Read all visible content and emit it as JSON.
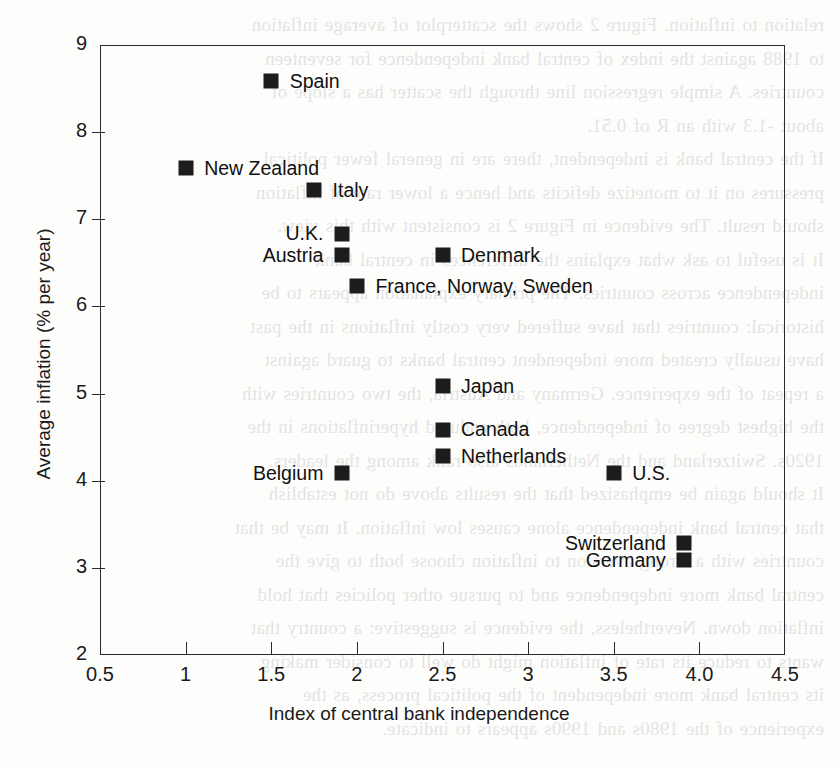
{
  "figure": {
    "background_color": "#ffffff",
    "marker_color": "#1c1c1c",
    "axis_color": "#2b2b2b"
  },
  "chart_data": {
    "type": "scatter",
    "title": "",
    "xlabel": "Index of central bank independence",
    "ylabel": "Average inflation (% per year)",
    "xlim": [
      0.5,
      4.5
    ],
    "ylim": [
      2,
      9
    ],
    "xticks": [
      0.5,
      1,
      1.5,
      2,
      2.5,
      3,
      3.5,
      4.0,
      4.5
    ],
    "xtick_labels": [
      "0.5",
      "1",
      "1.5",
      "2",
      "2.5",
      "3",
      "3.5",
      "4.0",
      "4.5"
    ],
    "yticks": [
      2,
      3,
      4,
      5,
      6,
      7,
      8,
      9
    ],
    "ytick_labels": [
      "2",
      "3",
      "4",
      "5",
      "6",
      "7",
      "8",
      "9"
    ],
    "grid": false,
    "legend": false,
    "marker": "square",
    "points": [
      {
        "label": "Spain",
        "x": 1.5,
        "y": 8.5,
        "label_side": "right"
      },
      {
        "label": "New Zealand",
        "x": 1.0,
        "y": 7.5,
        "label_side": "right"
      },
      {
        "label": "Italy",
        "x": 1.75,
        "y": 7.25,
        "label_side": "right"
      },
      {
        "label": "U.K.",
        "x": 2.0,
        "y": 6.75,
        "label_side": "left"
      },
      {
        "label": "Austria",
        "x": 2.0,
        "y": 6.5,
        "label_side": "left"
      },
      {
        "label": "Denmark",
        "x": 2.5,
        "y": 6.5,
        "label_side": "right"
      },
      {
        "label": "France, Norway, Sweden",
        "x": 2.0,
        "y": 6.15,
        "label_side": "right"
      },
      {
        "label": "Japan",
        "x": 2.5,
        "y": 5.0,
        "label_side": "right"
      },
      {
        "label": "Canada",
        "x": 2.5,
        "y": 4.5,
        "label_side": "right"
      },
      {
        "label": "Netherlands",
        "x": 2.5,
        "y": 4.2,
        "label_side": "right"
      },
      {
        "label": "Belgium",
        "x": 2.0,
        "y": 4.0,
        "label_side": "left"
      },
      {
        "label": "U.S.",
        "x": 3.5,
        "y": 4.0,
        "label_side": "right"
      },
      {
        "label": "Switzerland",
        "x": 4.0,
        "y": 3.2,
        "label_side": "left"
      },
      {
        "label": "Germany",
        "x": 4.0,
        "y": 3.0,
        "label_side": "left"
      }
    ]
  },
  "background_text": {
    "note": "faint reversed bleed-through text from the opposite page of the scanned book",
    "lines": [
      "relation to inflation. Figure 2 shows the scatterplot of average inflation",
      "to 1988 against the index of central bank independence for seventeen",
      "countries. A simple regression line through the scatter has a slope of",
      "about -1.3 with an R of 0.51.",
      "If the central bank is independent, there are in general fewer political",
      "pressures on it to monetize deficits and hence a lower rate of inflation",
      "should result. The evidence in Figure 2 is consistent with this view.",
      "It is useful to ask what explains the differences in central bank",
      "independence across countries. The primary explanation appears to be",
      "historical: countries that have suffered very costly inflations in the past",
      "have usually created more independent central banks to guard against",
      "a repeat of the experience. Germany and Austria, the two countries with",
      "the highest degree of independence, both endured hyperinflations in the",
      "1920s. Switzerland and the Netherlands also rank among the leaders.",
      "It should again be emphasized that the results above do not establish",
      "that central bank independence alone causes low inflation. It may be that",
      "countries with a strong aversion to inflation choose both to give the",
      "central bank more independence and to pursue other policies that hold",
      "inflation down. Nevertheless, the evidence is suggestive: a country that",
      "wants to reduce its rate of inflation might do well to consider making",
      "its central bank more independent of the political process, as the",
      "experience of the 1980s and 1990s appears to indicate."
    ]
  }
}
